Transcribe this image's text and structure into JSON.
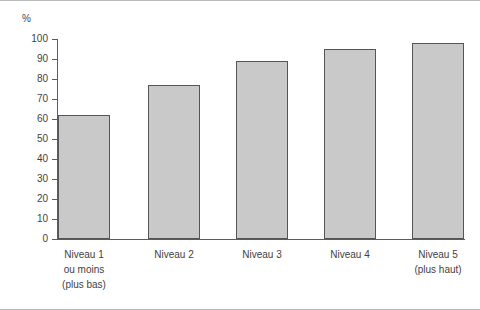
{
  "unit_label": "%",
  "chart_data": {
    "type": "bar",
    "title": "",
    "xlabel": "",
    "ylabel": "%",
    "ylim": [
      0,
      100
    ],
    "yticks": [
      0,
      10,
      20,
      30,
      40,
      50,
      60,
      70,
      80,
      90,
      100
    ],
    "grid": false,
    "legend": "none",
    "categories": [
      "Niveau 1 ou moins (plus bas)",
      "Niveau 2",
      "Niveau 3",
      "Niveau 4",
      "Niveau 5 (plus haut)"
    ],
    "category_label_lines": [
      [
        "Niveau 1",
        "ou moins",
        "(plus bas)"
      ],
      [
        "Niveau 2"
      ],
      [
        "Niveau 3"
      ],
      [
        "Niveau 4"
      ],
      [
        "Niveau 5",
        "(plus haut)"
      ]
    ],
    "values": [
      62,
      77,
      89,
      95,
      98
    ],
    "bar_fill_color": "#c9c9c9",
    "bar_border_color": "#555555",
    "axis_color": "#5c5c5c"
  }
}
